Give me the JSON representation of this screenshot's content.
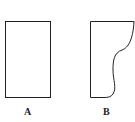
{
  "figure": {
    "shapes": [
      {
        "id": "A",
        "label": "A",
        "kind": "rectangle"
      },
      {
        "id": "B",
        "label": "B",
        "kind": "rectangle-with-curved-right-edge"
      }
    ],
    "stroke_color": "#222222",
    "background": "#ffffff"
  }
}
